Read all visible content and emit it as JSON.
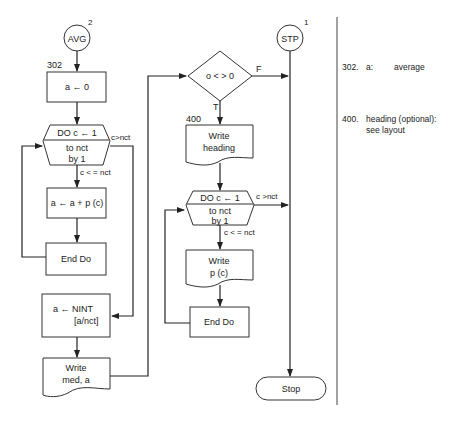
{
  "left_flow": {
    "connector": {
      "label": "AVG",
      "number": "2"
    },
    "step_number": "302",
    "init_box": "a ← 0",
    "do_loop": {
      "line1": "DO c ← 1",
      "line2": "to nct",
      "line3": "by 1",
      "exit_label": "c>nct",
      "continue_label": "c < = nct"
    },
    "sum_box": "a ← a + p (c)",
    "end_do": "End Do",
    "nint_box": {
      "line1": "a ← NINT",
      "line2": "[a/nct]"
    },
    "write_doc": {
      "line1": "Write",
      "line2": "med, a"
    }
  },
  "right_flow": {
    "decision": {
      "label": "o < > 0",
      "false_label": "F",
      "true_label": "T"
    },
    "step_number": "400",
    "write_heading": {
      "line1": "Write",
      "line2": "heading"
    },
    "do_loop": {
      "line1": "DO c ← 1",
      "line2": "to nct",
      "line3": "by 1",
      "exit_label": "c >nct",
      "continue_label": "c < = nct"
    },
    "write_p": {
      "line1": "Write",
      "line2": "p (c)"
    },
    "end_do": "End Do",
    "stp_connector": {
      "label": "STP",
      "number": "1"
    },
    "terminal": "Stop"
  },
  "notes": [
    {
      "num": "302.",
      "key": "a:",
      "desc": "average"
    },
    {
      "num": "400.",
      "key": "heading (optional):",
      "desc": "see layout"
    }
  ]
}
